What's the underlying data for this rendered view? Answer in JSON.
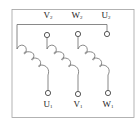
{
  "diagram": {
    "type": "motor-winding-terminal-diagram",
    "colors": {
      "line": "#6b6b6b",
      "border": "#9a9a9a",
      "text": "#222222",
      "background": "#ffffff"
    },
    "top_labels": [
      {
        "letter": "V",
        "sub": "2",
        "x": 48
      },
      {
        "letter": "W",
        "sub": "2",
        "x": 77
      },
      {
        "letter": "U",
        "sub": "2",
        "x": 106
      }
    ],
    "bottom_labels": [
      {
        "letter": "U",
        "sub": "1",
        "x": 47
      },
      {
        "letter": "V",
        "sub": "1",
        "x": 78
      },
      {
        "letter": "W",
        "sub": "1",
        "x": 108
      }
    ],
    "windings": [
      {
        "name": "winding-1",
        "from": "U2 (via top bus)",
        "to": "U1"
      },
      {
        "name": "winding-2",
        "from": "V2",
        "to": "V1"
      },
      {
        "name": "winding-3",
        "from": "W2",
        "to": "W1"
      }
    ]
  }
}
